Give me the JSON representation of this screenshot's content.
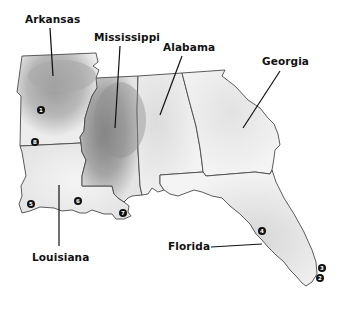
{
  "map": {
    "states": [
      {
        "name": "Arkansas",
        "label": "Arkansas"
      },
      {
        "name": "Mississippi",
        "label": "Mississippi"
      },
      {
        "name": "Alabama",
        "label": "Alabama"
      },
      {
        "name": "Georgia",
        "label": "Georgia"
      },
      {
        "name": "Louisiana",
        "label": "Louisiana"
      },
      {
        "name": "Florida",
        "label": "Florida"
      }
    ],
    "markers": [
      {
        "id": "1",
        "state": "Arkansas"
      },
      {
        "id": "2",
        "state": "Florida"
      },
      {
        "id": "3",
        "state": "Florida"
      },
      {
        "id": "4",
        "state": "Florida"
      },
      {
        "id": "5",
        "state": "Louisiana"
      },
      {
        "id": "6",
        "state": "Louisiana"
      },
      {
        "id": "7",
        "state": "Louisiana"
      },
      {
        "id": "8",
        "state": "Louisiana"
      }
    ],
    "colors": {
      "shade_dark": "#8c8c8c",
      "shade_light": "#e6e6e6",
      "border": "#4a4a4a",
      "label": "#111111"
    }
  }
}
